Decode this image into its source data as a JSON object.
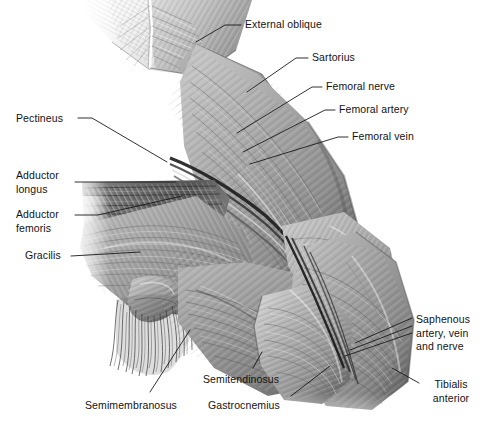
{
  "figure": {
    "background_color": "#ffffff",
    "label_color": "#121212",
    "leader_color": "#1a1a1a",
    "art_tone_light": "#f2f2f2",
    "art_tone_mid": "#9a9a9a",
    "art_tone_dark": "#3a3a3a"
  },
  "labels": [
    {
      "id": "external-oblique",
      "text": "External oblique",
      "lines": [
        "External oblique"
      ],
      "x": 245,
      "y": 18,
      "align": "left"
    },
    {
      "id": "sartorius",
      "text": "Sartorius",
      "lines": [
        "Sartorius"
      ],
      "x": 312,
      "y": 51,
      "align": "left"
    },
    {
      "id": "femoral-nerve",
      "text": "Femoral nerve",
      "lines": [
        "Femoral nerve"
      ],
      "x": 326,
      "y": 80,
      "align": "left"
    },
    {
      "id": "femoral-artery",
      "text": "Femoral artery",
      "lines": [
        "Femoral artery"
      ],
      "x": 339,
      "y": 103,
      "align": "left"
    },
    {
      "id": "femoral-vein",
      "text": "Femoral vein",
      "lines": [
        "Femoral vein"
      ],
      "x": 352,
      "y": 130,
      "align": "left"
    },
    {
      "id": "pectineus",
      "text": "Pectineus",
      "lines": [
        "Pectineus"
      ],
      "x": 16,
      "y": 112,
      "align": "left"
    },
    {
      "id": "adductor-longus",
      "text": "Adductor longus",
      "lines": [
        "Adductor",
        "longus"
      ],
      "x": 16,
      "y": 169,
      "align": "left"
    },
    {
      "id": "adductor-femoris",
      "text": "Adductor femoris",
      "lines": [
        "Adductor",
        "femoris"
      ],
      "x": 16,
      "y": 208,
      "align": "left"
    },
    {
      "id": "gracilis",
      "text": "Gracilis",
      "lines": [
        "Gracilis"
      ],
      "x": 25,
      "y": 249,
      "align": "left"
    },
    {
      "id": "semimembranosus",
      "text": "Semimembranosus",
      "lines": [
        "Semimembranosus"
      ],
      "x": 85,
      "y": 399,
      "align": "left"
    },
    {
      "id": "semitendinosus",
      "text": "Semitendinosus",
      "lines": [
        "Semitendinosus"
      ],
      "x": 203,
      "y": 373,
      "align": "left"
    },
    {
      "id": "gastrocnemius",
      "text": "Gastrocnemius",
      "lines": [
        "Gastrocnemius"
      ],
      "x": 208,
      "y": 399,
      "align": "left"
    },
    {
      "id": "saphenous",
      "text": "Saphenous artery, vein and nerve",
      "lines": [
        "Saphenous",
        "artery, vein",
        "and nerve"
      ],
      "x": 416,
      "y": 313,
      "align": "left"
    },
    {
      "id": "tibialis-anterior",
      "text": "Tibialis anterior",
      "lines": [
        "Tibialis",
        "anterior"
      ],
      "x": 423,
      "y": 378,
      "align": "left"
    }
  ],
  "leaders": [
    {
      "id": "leader-external-oblique",
      "points": "241,25 225,25 196,42"
    },
    {
      "id": "leader-sartorius",
      "points": "308,58 296,58 247,92"
    },
    {
      "id": "leader-femoral-nerve",
      "points": "322,87 312,87 237,133"
    },
    {
      "id": "leader-femoral-artery",
      "points": "335,110 325,110 243,152"
    },
    {
      "id": "leader-femoral-vein",
      "points": "348,137 338,137 250,164"
    },
    {
      "id": "leader-pectineus",
      "points": "78,118 92,118 167,162"
    },
    {
      "id": "leader-adductor-longus",
      "points": "75,182 176,182"
    },
    {
      "id": "leader-adductor-femoris",
      "points": "75,215 98,215 182,196"
    },
    {
      "id": "leader-gracilis",
      "points": "71,256 140,252"
    },
    {
      "id": "leader-semimembranosus",
      "points": "150,392 190,330"
    },
    {
      "id": "leader-semitendinosus",
      "points": "253,368 262,352"
    },
    {
      "id": "leader-gastrocnemius",
      "points": "291,396 330,366"
    },
    {
      "id": "leader-saphenous-1",
      "points": "412,318 355,343"
    },
    {
      "id": "leader-saphenous-2",
      "points": "412,326 350,350"
    },
    {
      "id": "leader-saphenous-3",
      "points": "412,333 345,356"
    },
    {
      "id": "leader-tibialis-anterior",
      "points": "419,383 392,368"
    }
  ]
}
